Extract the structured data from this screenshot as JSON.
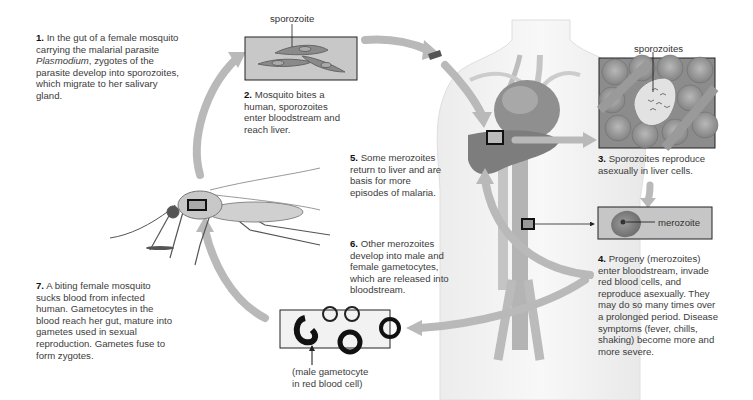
{
  "diagram": {
    "steps": [
      {
        "num": "1.",
        "text_before": " In the gut of a female mosquito carrying the malarial parasite ",
        "italic": "Plasmodium",
        "text_after": ", zygotes of the parasite develop into sporozoites, which migrate to her salivary gland."
      },
      {
        "num": "2.",
        "text": " Mosquito bites a human, sporozoites enter bloodstream and reach liver."
      },
      {
        "num": "3.",
        "text": " Sporozoites reproduce asexually in liver cells."
      },
      {
        "num": "4.",
        "text": " Progeny (merozoites) enter bloodstream, invade red blood cells, and reproduce asexually. They may do so many times over a prolonged period. Disease symptoms (fever, chills, shaking) become more and more severe."
      },
      {
        "num": "5.",
        "text": " Some merozoites return to liver and are basis for more episodes of malaria."
      },
      {
        "num": "6.",
        "text": " Other merozoites develop into male and female gametocytes, which are released into bloodstream."
      },
      {
        "num": "7.",
        "text": " A biting female mosquito sucks blood from infected human. Gametocytes in the blood reach her gut, mature into gametes used in sexual reproduction. Gametes fuse to form zygotes."
      }
    ],
    "labels": {
      "sporozoite": "sporozoite",
      "sporozoites": "sporozoites",
      "merozoite": "merozoite",
      "gametocyte_caption_line1": "(male gametocyte",
      "gametocyte_caption_line2": "in red blood cell)"
    },
    "colors": {
      "arrow": "#b5b5b5",
      "panel_border": "#222222",
      "panel_fill": "#c8c8c8",
      "text": "#3c3c3c"
    }
  }
}
